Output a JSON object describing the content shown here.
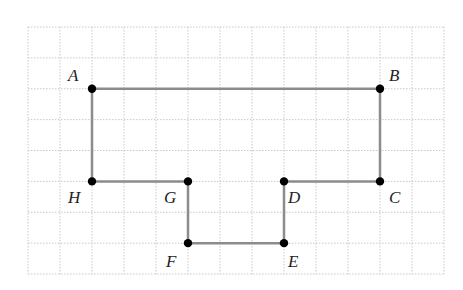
{
  "diagram": {
    "type": "polygon-on-grid",
    "grid": {
      "origin_x": 28,
      "origin_y": 27,
      "cols": 13,
      "rows": 8,
      "cell_w": 32,
      "cell_h": 30.875,
      "line_color": "#c8c8c8",
      "style": "dotted"
    },
    "polygon": {
      "stroke": "#8c8c8c",
      "stroke_width": 2.5,
      "vertex_color": "#000000",
      "order": [
        "A",
        "B",
        "C",
        "D",
        "E",
        "F",
        "G",
        "H"
      ]
    },
    "points": [
      {
        "name": "A",
        "gx": 2,
        "gy": 2,
        "label_dx": -24,
        "label_dy": -22
      },
      {
        "name": "B",
        "gx": 11,
        "gy": 2,
        "label_dx": 9,
        "label_dy": -22
      },
      {
        "name": "C",
        "gx": 11,
        "gy": 5,
        "label_dx": 9,
        "label_dy": 8
      },
      {
        "name": "D",
        "gx": 8,
        "gy": 5,
        "label_dx": 4,
        "label_dy": 8
      },
      {
        "name": "E",
        "gx": 8,
        "gy": 7,
        "label_dx": 4,
        "label_dy": 10
      },
      {
        "name": "F",
        "gx": 5,
        "gy": 7,
        "label_dx": -22,
        "label_dy": 10
      },
      {
        "name": "G",
        "gx": 5,
        "gy": 5,
        "label_dx": -24,
        "label_dy": 8
      },
      {
        "name": "H",
        "gx": 2,
        "gy": 5,
        "label_dx": -24,
        "label_dy": 8
      }
    ],
    "labels": {
      "A": "A",
      "B": "B",
      "C": "C",
      "D": "D",
      "E": "E",
      "F": "F",
      "G": "G",
      "H": "H"
    }
  }
}
